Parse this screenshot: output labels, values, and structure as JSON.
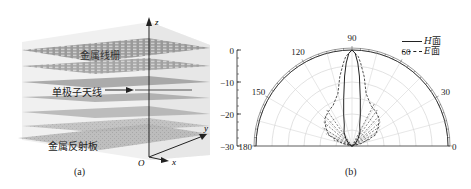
{
  "figure": {
    "panel_a": {
      "caption": "(a)",
      "labels": {
        "grid": "金属线栅",
        "antenna": "单极子天线",
        "reflector": "金属反射板"
      },
      "axes": {
        "z": "z",
        "y": "y",
        "x": "x",
        "origin": "O"
      }
    },
    "panel_b": {
      "caption": "(b)",
      "legend": [
        {
          "name": "H 面",
          "italic": "H",
          "suffix": " 面",
          "style": "solid"
        },
        {
          "name": "E 面",
          "italic": "E",
          "suffix": " 面",
          "style": "dashed"
        }
      ],
      "radial_ticks": [
        "0",
        "−10",
        "−20",
        "−30"
      ],
      "angle_ticks": [
        "180",
        "150",
        "120",
        "90",
        "60",
        "30",
        "0"
      ]
    }
  },
  "chart_data": {
    "type": "polar",
    "title": "",
    "rlabel": "dB",
    "rlim": [
      -30,
      0
    ],
    "theta_range": [
      0,
      180
    ],
    "theta_ticks": [
      0,
      30,
      60,
      90,
      120,
      150,
      180
    ],
    "r_ticks": [
      0,
      -10,
      -20,
      -30
    ],
    "legend": [
      "H 面",
      "E 面"
    ],
    "legend_position": "top-right",
    "series": [
      {
        "name": "H 面",
        "style": "solid",
        "theta": [
          0,
          30,
          50,
          60,
          70,
          75,
          80,
          84,
          86,
          88,
          90,
          92,
          94,
          96,
          100,
          105,
          110,
          120,
          130,
          150,
          180
        ],
        "r": [
          -30,
          -29,
          -27,
          -25,
          -23,
          -20,
          -15,
          -8,
          -4,
          -1,
          0,
          -1,
          -4,
          -8,
          -15,
          -20,
          -23,
          -25,
          -27,
          -29,
          -30
        ]
      },
      {
        "name": "E 面",
        "style": "dashed",
        "theta": [
          0,
          15,
          25,
          35,
          45,
          55,
          65,
          75,
          80,
          84,
          86,
          88,
          90,
          92,
          94,
          96,
          100,
          105,
          115,
          125,
          135,
          145,
          155,
          165,
          180
        ],
        "r": [
          -30,
          -27,
          -22,
          -20,
          -18,
          -17,
          -16,
          -13,
          -8,
          -4,
          -2,
          -1,
          0,
          -1,
          -2,
          -4,
          -8,
          -13,
          -16,
          -17,
          -18,
          -20,
          -22,
          -27,
          -30
        ]
      }
    ]
  }
}
